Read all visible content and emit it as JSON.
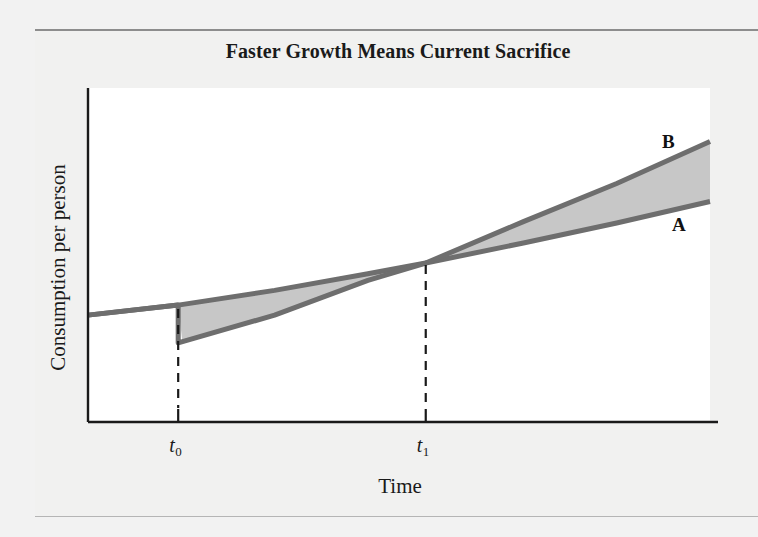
{
  "figure": {
    "title": "Faster Growth Means Current Sacrifice",
    "background_color": "#f1f1f0",
    "plot_background_color": "#ffffff",
    "rule_color": "#8d8d8d"
  },
  "chart_data": {
    "type": "line",
    "title": "Faster Growth Means Current Sacrifice",
    "xlabel": "Time",
    "ylabel": "Consumption per person",
    "grid": false,
    "legend_position": "inline-right",
    "axis_style": "schematic-no-numeric-scale",
    "xticks": [
      {
        "label": "t",
        "subscript": "0",
        "position": 0.145
      },
      {
        "label": "t",
        "subscript": "1",
        "position": 0.543
      }
    ],
    "yticks": [],
    "xlim": [
      0,
      1
    ],
    "ylim": [
      0,
      1
    ],
    "annotations": [
      {
        "name": "drop-at-t0",
        "text": "",
        "note": "Curve B drops vertically at t0 (current sacrifice)"
      },
      {
        "name": "crossing-at-t1",
        "text": "",
        "note": "Curve B overtakes curve A at t1"
      }
    ],
    "series": [
      {
        "name": "A",
        "label": "A",
        "color": "#6e6e6e",
        "description": "Baseline consumption path: slow steady growth",
        "x": [
          0.0,
          0.145,
          0.3,
          0.45,
          0.543,
          0.7,
          0.85,
          1.0
        ],
        "y": [
          0.32,
          0.35,
          0.394,
          0.444,
          0.476,
          0.536,
          0.596,
          0.66
        ]
      },
      {
        "name": "B",
        "label": "B",
        "color": "#6e6e6e",
        "description": "Higher-growth path: consumption drops at t0 then grows faster, crossing A at t1",
        "x": [
          0.0,
          0.145,
          0.145,
          0.3,
          0.45,
          0.543,
          0.7,
          0.85,
          1.0
        ],
        "y": [
          0.32,
          0.35,
          0.237,
          0.32,
          0.424,
          0.476,
          0.6,
          0.714,
          0.84
        ]
      }
    ],
    "shaded_regions": [
      {
        "name": "sacrifice-region",
        "between": [
          "A",
          "B"
        ],
        "from": 0.145,
        "to": 0.543,
        "fill": "#c7c7c7"
      },
      {
        "name": "gain-region",
        "between": [
          "A",
          "B"
        ],
        "from": 0.543,
        "to": 1.0,
        "fill": "#c7c7c7"
      }
    ]
  },
  "labels": {
    "curve_a": "A",
    "curve_b": "B",
    "tick_t0_var": "t",
    "tick_t0_sub": "0",
    "tick_t1_var": "t",
    "tick_t1_sub": "1"
  }
}
